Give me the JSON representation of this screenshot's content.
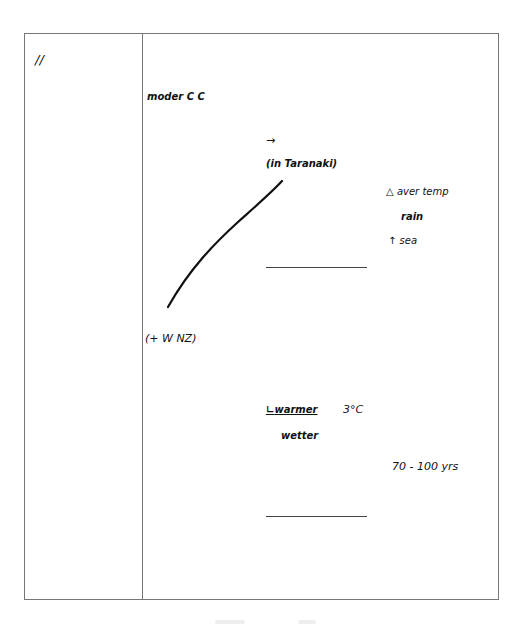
{
  "left_column": {
    "marker": "//"
  },
  "notes": {
    "heading": "moder C C",
    "arrow": "→",
    "location": "(in Taranaki)",
    "region": "(+ W NZ)",
    "effects": {
      "delta": "△",
      "aver_temp": "aver temp",
      "rain": "rain",
      "sea_arrow": "↑",
      "sea": "sea"
    },
    "forecast": {
      "warmer_mark": "∟",
      "warmer": "warmer",
      "degrees": "3°C",
      "wetter": "wetter",
      "timeframe": "70 - 100 yrs"
    }
  }
}
